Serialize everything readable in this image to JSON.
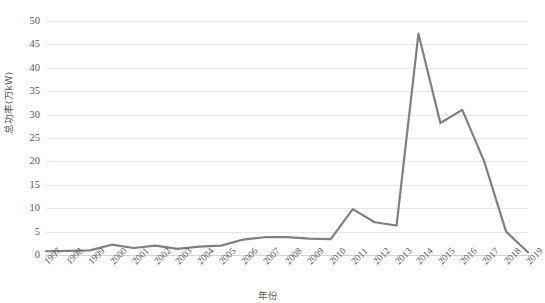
{
  "chart_data": {
    "type": "line",
    "title": "",
    "xlabel": "年份",
    "ylabel": "总功率(万kW)",
    "ylim": [
      0,
      50
    ],
    "ytick_step": 5,
    "yticks": [
      "50",
      "45",
      "40",
      "35",
      "30",
      "25",
      "20",
      "15",
      "10",
      "5",
      "0"
    ],
    "grid": true,
    "legend": "none",
    "line_color": "#808080",
    "categories": [
      "1997",
      "1998",
      "1999",
      "2000",
      "2001",
      "2002",
      "2003",
      "2004",
      "2005",
      "2006",
      "2007",
      "2008",
      "2009",
      "2010",
      "2011",
      "2012",
      "2013",
      "2014",
      "2015",
      "2016",
      "2017",
      "2018",
      "2019"
    ],
    "series": [
      {
        "name": "总功率",
        "values": [
          0.8,
          0.9,
          1.0,
          2.2,
          1.5,
          2.0,
          1.3,
          1.8,
          2.0,
          3.3,
          3.8,
          3.8,
          3.5,
          3.4,
          9.8,
          7.0,
          6.3,
          47.3,
          28.2,
          31.0,
          20.0,
          5.0,
          0.6
        ]
      }
    ]
  }
}
